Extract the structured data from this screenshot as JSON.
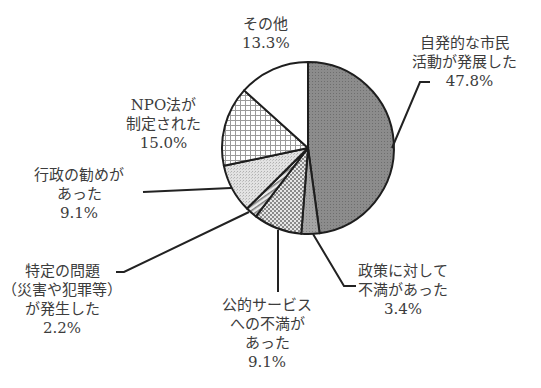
{
  "chart_data": {
    "type": "pie",
    "title": "",
    "start_angle_deg": 90,
    "direction": "clockwise",
    "center": [
      308,
      148
    ],
    "radius": 86,
    "slices": [
      {
        "label": "自発的な市民活動が発展した",
        "value": 47.8,
        "pattern": "dark-gray",
        "fill": "#8a8a8a"
      },
      {
        "label": "政策に対して不満があった",
        "value": 3.4,
        "pattern": "medium-gray",
        "fill": "#9c9c9c"
      },
      {
        "label": "公的サービスへの不満があった",
        "value": 9.1,
        "pattern": "crosshatch-dots",
        "fill": "#c8c8c8"
      },
      {
        "label": "特定の問題（災害や犯罪等）が発生した",
        "value": 2.2,
        "pattern": "diagonal-stripes",
        "fill": "#b8b8b8"
      },
      {
        "label": "行政の勧めがあった",
        "value": 9.1,
        "pattern": "light-dots",
        "fill": "#dcdcdc"
      },
      {
        "label": "NPO法が制定された",
        "value": 15.0,
        "pattern": "grid",
        "fill": "#e8e8e8"
      },
      {
        "label": "その他",
        "value": 13.3,
        "pattern": "white",
        "fill": "#ffffff"
      }
    ],
    "categories": [
      "自発的な市民活動が発展した",
      "政策に対して不満があった",
      "公的サービスへの不満があった",
      "特定の問題（災害や犯罪等）が発生した",
      "行政の勧めがあった",
      "NPO法が制定された",
      "その他"
    ],
    "values": [
      47.8,
      3.4,
      9.1,
      2.2,
      9.1,
      15.0,
      13.3
    ],
    "unit": "%",
    "legend": "none (callout labels)"
  },
  "labels": {
    "civic": {
      "lines": [
        "自発的な市民",
        "活動が発展した"
      ],
      "pct": "47.8%"
    },
    "policy": {
      "lines": [
        "政策に対して",
        "不満があった"
      ],
      "pct": "3.4%"
    },
    "service": {
      "lines": [
        "公的サービス",
        "への不満が",
        "あった"
      ],
      "pct": "9.1%"
    },
    "problem": {
      "lines": [
        "特定の問題",
        "（災害や犯罪等）",
        "が発生した"
      ],
      "pct": "2.2%"
    },
    "admin": {
      "lines": [
        "行政の勧めが",
        "あった"
      ],
      "pct": "9.1%"
    },
    "npo": {
      "lines": [
        "NPO法が",
        "制定された"
      ],
      "pct": "15.0%"
    },
    "other": {
      "lines": [
        "その他"
      ],
      "pct": "13.3%"
    }
  }
}
